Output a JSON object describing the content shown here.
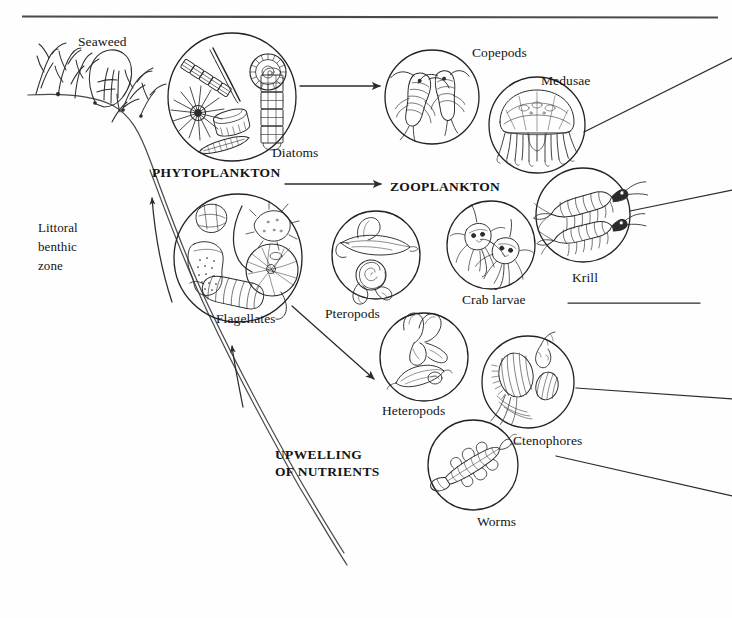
{
  "diagram": {
    "style": {
      "ink": "#1a1a1a",
      "line": "#3a3a3a",
      "background": "#ffffff"
    },
    "top_rule": {
      "name": "sea-surface-line",
      "x1": 22,
      "y1": 16,
      "x2": 718,
      "y2": 17
    },
    "zone_labels": [
      {
        "id": "littoral",
        "text": "Littoral\nbenthic\nzone",
        "x": 38,
        "y": 219
      }
    ],
    "group_labels": [
      {
        "id": "phytoplankton",
        "text": "PHYTOPLANKTON",
        "x": 152,
        "y": 164,
        "bold": true
      },
      {
        "id": "zooplankton",
        "text": "ZOOPLANKTON",
        "x": 390,
        "y": 178,
        "bold": true
      },
      {
        "id": "upwelling",
        "text": "UPWELLING\nOF NUTRIENTS",
        "x": 275,
        "y": 446,
        "bold": true
      }
    ],
    "organisms": [
      {
        "id": "seaweed",
        "label": "Seaweed",
        "label_x": 78,
        "label_y": 33,
        "cx": null,
        "cy": null,
        "r": null
      },
      {
        "id": "diatoms",
        "label": "Diatoms",
        "label_x": 272,
        "label_y": 144,
        "cx": 232,
        "cy": 97,
        "r": 64
      },
      {
        "id": "flagellates",
        "label": "Flagellates",
        "label_x": 216,
        "label_y": 310,
        "cx": 238,
        "cy": 258,
        "r": 64
      },
      {
        "id": "copepods",
        "label": "Copepods",
        "label_x": 472,
        "label_y": 44,
        "cx": 432,
        "cy": 97,
        "r": 47
      },
      {
        "id": "medusae",
        "label": "Medusae",
        "label_x": 541,
        "label_y": 72,
        "cx": 537,
        "cy": 125,
        "r": 48
      },
      {
        "id": "krill",
        "label": "Krill",
        "label_x": 572,
        "label_y": 269,
        "cx": 583,
        "cy": 215,
        "r": 47
      },
      {
        "id": "pteropods",
        "label": "Pteropods",
        "label_x": 325,
        "label_y": 305,
        "cx": 376,
        "cy": 255,
        "r": 44
      },
      {
        "id": "crab-larvae",
        "label": "Crab larvae",
        "label_x": 462,
        "label_y": 291,
        "cx": 491,
        "cy": 245,
        "r": 44
      },
      {
        "id": "heteropods",
        "label": "Heteropods",
        "label_x": 382,
        "label_y": 402,
        "cx": 424,
        "cy": 357,
        "r": 44
      },
      {
        "id": "ctenophores",
        "label": "Ctenophores",
        "label_x": 513,
        "label_y": 432,
        "cx": 528,
        "cy": 382,
        "r": 46
      },
      {
        "id": "worms",
        "label": "Worms",
        "label_x": 477,
        "label_y": 513,
        "cx": 473,
        "cy": 465,
        "r": 45
      }
    ],
    "flow_arrows": [
      {
        "id": "diatoms-to-copepods",
        "from": "diatoms",
        "to": "copepods",
        "x1": 300,
        "y1": 86,
        "x2": 382,
        "y2": 86
      },
      {
        "id": "flagellates-to-zooplankton",
        "from": "flagellates",
        "to": "zooplankton",
        "x1": 285,
        "y1": 184,
        "x2": 382,
        "y2": 184
      },
      {
        "id": "flagellates-to-heteropods",
        "from": "flagellates",
        "to": "heteropods",
        "x1": 290,
        "y1": 305,
        "x2": 377,
        "y2": 382
      },
      {
        "id": "upwelling-arrow-left",
        "from": "deep-water",
        "to": "flagellates",
        "x1": 170,
        "y1": 300,
        "x2": 152,
        "y2": 192
      },
      {
        "id": "upwelling-arrow-right",
        "from": "deep-water",
        "to": "flagellates",
        "x1": 241,
        "y1": 405,
        "x2": 232,
        "y2": 342
      }
    ],
    "link_lines": [
      {
        "id": "medusae-to-offpanel",
        "x1": 584,
        "y1": 132,
        "x2": 732,
        "y2": 58
      },
      {
        "id": "krill-to-offpanel",
        "x1": 630,
        "y1": 211,
        "x2": 732,
        "y2": 190
      },
      {
        "id": "krill-label-rule",
        "x1": 568,
        "y1": 303,
        "x2": 700,
        "y2": 303
      },
      {
        "id": "ctenophores-to-offpanel",
        "x1": 575,
        "y1": 388,
        "x2": 732,
        "y2": 398
      },
      {
        "id": "worms-to-offpanel",
        "x1": 555,
        "y1": 456,
        "x2": 732,
        "y2": 495
      }
    ],
    "slope": {
      "name": "continental-shelf-slope",
      "description": "Seafloor profile descending from the littoral shelf to the deep basin"
    }
  }
}
